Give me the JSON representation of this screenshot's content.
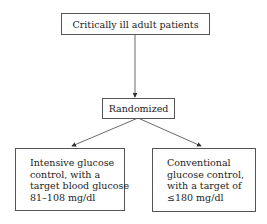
{
  "diagram": {
    "type": "flowchart",
    "nodes": {
      "population": {
        "label": "Critically ill adult patients"
      },
      "randomized": {
        "label": "Randomized"
      },
      "intensive": {
        "lines": [
          "Intensive glucose",
          "control, with a",
          "target blood glucose",
          "81–108 mg/dl"
        ]
      },
      "conventional": {
        "lines": [
          "Conventional",
          "glucose control,",
          "with a target of",
          "≤180 mg/dl"
        ]
      }
    },
    "edges": [
      {
        "from": "population",
        "to": "randomized"
      },
      {
        "from": "randomized",
        "to": "intensive"
      },
      {
        "from": "randomized",
        "to": "conventional"
      }
    ],
    "colors": {
      "line": "#444444",
      "border": "#555555",
      "text": "#222222"
    }
  }
}
